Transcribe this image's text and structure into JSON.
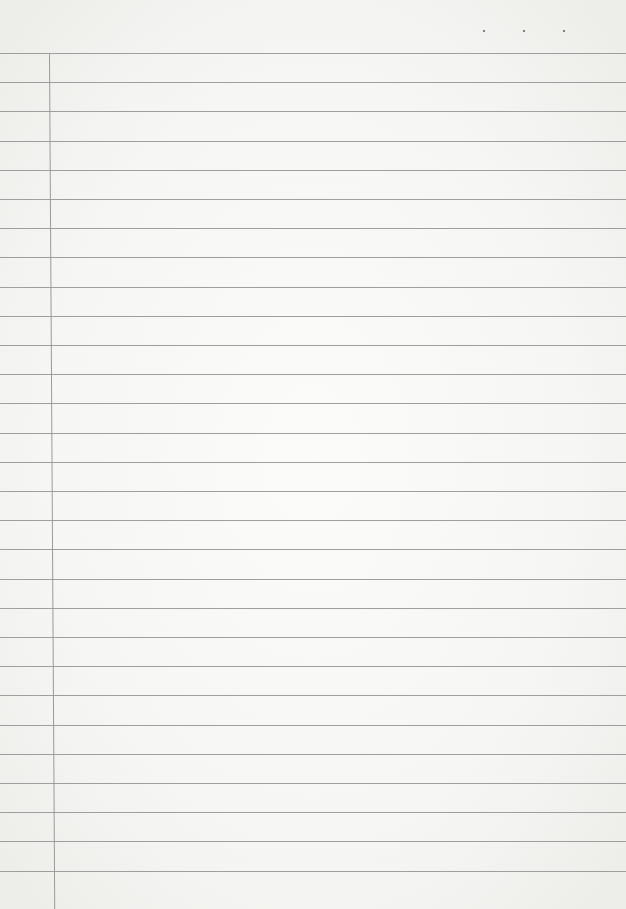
{
  "page": {
    "type": "lined-notebook-paper",
    "line_count": 29,
    "first_line_y": 53,
    "line_spacing": 29.2,
    "margin_x": 49,
    "top_dots_x": [
      483,
      523,
      563
    ],
    "colors": {
      "paper": "#f7f7f5",
      "rule": "#8f8f8f",
      "margin": "#9a9a9a"
    }
  }
}
